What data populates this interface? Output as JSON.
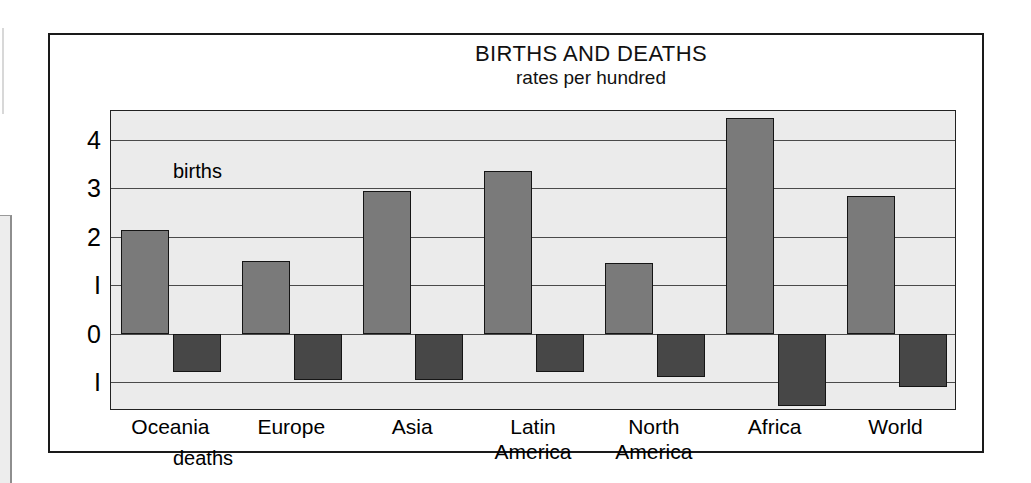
{
  "chart_data": {
    "type": "bar",
    "title": "BIRTHS AND DEATHS",
    "subtitle": "rates per hundred",
    "xlabel": "",
    "ylabel": "",
    "ylim": [
      -1.6,
      4.6
    ],
    "grid": true,
    "gridlines": [
      4,
      3,
      2,
      1,
      0,
      -1
    ],
    "ytick_labels": [
      "4",
      "3",
      "2",
      "I",
      "0",
      "I"
    ],
    "ytick_values": [
      4,
      3,
      2,
      1,
      0,
      -1
    ],
    "annotations": [
      {
        "text": "births",
        "position": "top-left-inside-plot"
      },
      {
        "text": "deaths",
        "position": "bottom-left-inside-plot"
      }
    ],
    "categories": [
      "Oceania",
      "Europe",
      "Asia",
      "Latin\nAmerica",
      "North\nAmerica",
      "Africa",
      "World"
    ],
    "category_lines": [
      [
        "Oceania"
      ],
      [
        "Europe"
      ],
      [
        "Asia"
      ],
      [
        "Latin",
        "America"
      ],
      [
        "North",
        "America"
      ],
      [
        "Africa"
      ],
      [
        "World"
      ]
    ],
    "series": [
      {
        "name": "births",
        "color": "#7a7a7a",
        "direction": "up",
        "values": [
          2.15,
          1.5,
          2.95,
          3.35,
          1.45,
          4.45,
          2.85
        ]
      },
      {
        "name": "deaths",
        "color": "#474747",
        "direction": "down",
        "values": [
          0.8,
          0.95,
          0.95,
          0.8,
          0.9,
          1.5,
          1.1
        ]
      }
    ],
    "legend_position": "inline-annotation",
    "background_color": "#ebebeb",
    "frame_color": "#1a1a1a"
  }
}
